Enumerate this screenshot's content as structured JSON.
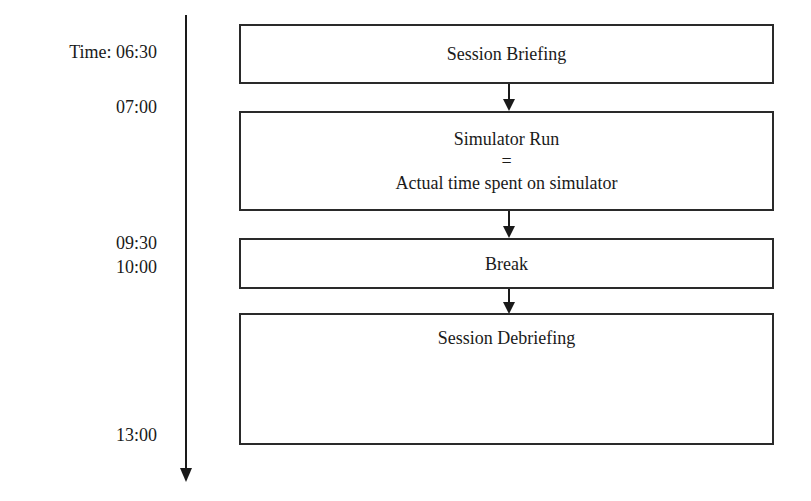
{
  "timeline": {
    "labels": [
      {
        "text": "Time:  06:30",
        "y": 42
      },
      {
        "text": "07:00",
        "y": 97
      },
      {
        "text": "09:30",
        "y": 233
      },
      {
        "text": "10:00",
        "y": 257
      },
      {
        "text": "13:00",
        "y": 425
      }
    ]
  },
  "boxes": [
    {
      "lines": [
        "Session Briefing"
      ]
    },
    {
      "lines": [
        "Simulator Run",
        "=",
        "Actual time spent on simulator"
      ]
    },
    {
      "lines": [
        "Break"
      ]
    },
    {
      "lines": [
        "Session Debriefing"
      ]
    }
  ],
  "colors": {
    "stroke": "#1a1a1a",
    "background": "#ffffff"
  }
}
